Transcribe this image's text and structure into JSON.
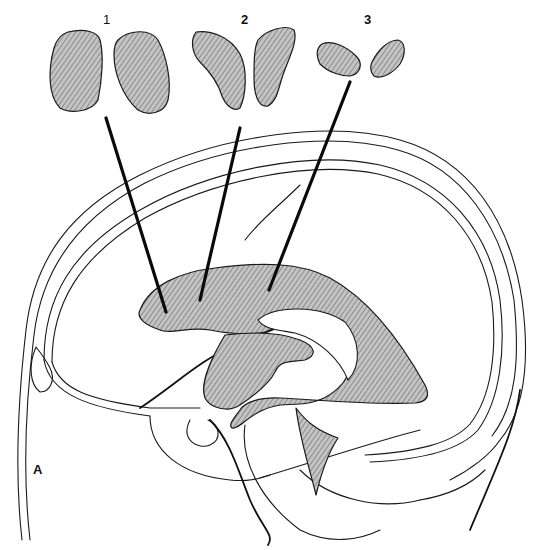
{
  "figure": {
    "panel_label": "A",
    "section_labels": [
      "1",
      "2",
      "3"
    ],
    "colors": {
      "ink": "#1a1a1a",
      "shading": "#b8b8b8",
      "background": "#ffffff"
    }
  }
}
